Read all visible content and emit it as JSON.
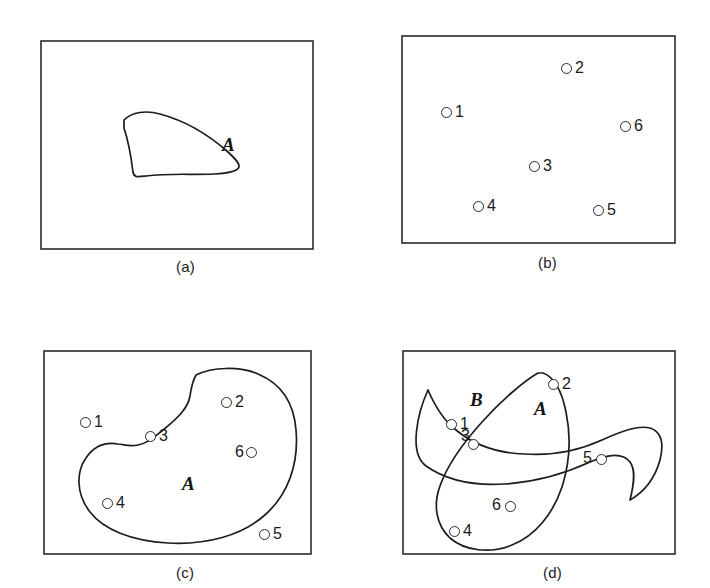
{
  "figure": {
    "width": 710,
    "height": 588,
    "background": "#ffffff",
    "ink_color": "#1a1a1a"
  },
  "panels": [
    {
      "id": "a",
      "caption": "(a)",
      "caption_x": 176,
      "caption_y": 258,
      "frame": {
        "x": 41,
        "y": 41,
        "w": 272,
        "h": 208
      },
      "region_labels": [
        {
          "text": "A",
          "x": 222,
          "y": 135
        }
      ],
      "points": [],
      "shapes": [
        {
          "name": "region-a-blob",
          "path": "M 124 120 C 132 112, 146 110, 160 114 C 186 121, 210 136, 228 152 C 241 164, 249 172, 214 174 C 190 175, 168 173, 146 176 C 138 177, 134 178, 133 172 C 131 156, 128 140, 124 128 Z"
        }
      ]
    },
    {
      "id": "b",
      "caption": "(b)",
      "caption_x": 538,
      "caption_y": 254,
      "frame": {
        "x": 402,
        "y": 36,
        "w": 273,
        "h": 207
      },
      "region_labels": [],
      "points": [
        {
          "id": "1",
          "cx": 446,
          "cy": 112,
          "label_x": 455,
          "label_y": 104
        },
        {
          "id": "2",
          "cx": 566,
          "cy": 68,
          "label_x": 575,
          "label_y": 60
        },
        {
          "id": "3",
          "cx": 534,
          "cy": 166,
          "label_x": 543,
          "label_y": 158
        },
        {
          "id": "4",
          "cx": 478,
          "cy": 206,
          "label_x": 487,
          "label_y": 198
        },
        {
          "id": "5",
          "cx": 598,
          "cy": 210,
          "label_x": 607,
          "label_y": 202
        },
        {
          "id": "6",
          "cx": 625,
          "cy": 126,
          "label_x": 634,
          "label_y": 118
        }
      ],
      "shapes": []
    },
    {
      "id": "c",
      "caption": "(c)",
      "caption_x": 176,
      "caption_y": 564,
      "frame": {
        "x": 44,
        "y": 351,
        "w": 267,
        "h": 203
      },
      "region_labels": [
        {
          "text": "A",
          "x": 182,
          "y": 474
        }
      ],
      "points": [
        {
          "id": "1",
          "cx": 85,
          "cy": 422,
          "label_x": 94,
          "label_y": 414
        },
        {
          "id": "2",
          "cx": 226,
          "cy": 402,
          "label_x": 235,
          "label_y": 394
        },
        {
          "id": "3",
          "cx": 150,
          "cy": 436,
          "label_x": 159,
          "label_y": 428
        },
        {
          "id": "4",
          "cx": 107,
          "cy": 503,
          "label_x": 116,
          "label_y": 495
        },
        {
          "id": "5",
          "cx": 264,
          "cy": 534,
          "label_x": 273,
          "label_y": 526
        },
        {
          "id": "6",
          "cx": 251,
          "cy": 452,
          "label_x": 235,
          "label_y": 444
        }
      ],
      "shapes": [
        {
          "name": "region-a-crescent",
          "path": "M 196 375 C 212 367, 240 366, 258 374 C 282 384, 294 404, 296 430 C 299 464, 288 494, 266 514 C 242 536, 206 545, 168 543 C 132 541, 104 530, 90 512 C 76 494, 76 472, 86 458 C 94 446, 106 442, 118 444 C 126 445, 130 447, 138 445 C 148 443, 154 437, 163 430 C 178 418, 188 408, 190 396 C 191 389, 192 382, 196 375 Z"
        }
      ]
    },
    {
      "id": "d",
      "caption": "(d)",
      "caption_x": 543,
      "caption_y": 564,
      "frame": {
        "x": 403,
        "y": 351,
        "w": 272,
        "h": 203
      },
      "region_labels": [
        {
          "text": "B",
          "x": 470,
          "y": 390
        },
        {
          "text": "A",
          "x": 534,
          "y": 399
        }
      ],
      "points": [
        {
          "id": "1",
          "cx": 451,
          "cy": 424,
          "label_x": 460,
          "label_y": 416
        },
        {
          "id": "2",
          "cx": 553,
          "cy": 384,
          "label_x": 562,
          "label_y": 376
        },
        {
          "id": "3",
          "cx": 473,
          "cy": 444,
          "label_x": 461,
          "label_y": 430
        },
        {
          "id": "4",
          "cx": 454,
          "cy": 531,
          "label_x": 463,
          "label_y": 523
        },
        {
          "id": "5",
          "cx": 601,
          "cy": 459,
          "label_x": 583,
          "label_y": 450
        },
        {
          "id": "6",
          "cx": 510,
          "cy": 506,
          "label_x": 492,
          "label_y": 497
        }
      ],
      "shapes": [
        {
          "name": "region-a-outline",
          "path": "M 543 373 C 554 377, 562 392, 566 412 C 571 436, 570 462, 562 487 C 553 514, 535 536, 512 545 C 490 554, 465 551, 450 538 C 436 525, 433 505, 440 486 C 448 463, 464 442, 482 422 C 502 400, 524 381, 538 373 Z"
        },
        {
          "name": "region-b-outline",
          "path": "M 428 390 C 434 404, 442 419, 456 430 C 474 445, 498 453, 524 454 C 552 456, 580 450, 602 440 C 622 431, 638 425, 650 428 C 662 432, 664 444, 660 460 C 655 478, 644 492, 630 500 C 634 484, 636 470, 630 462 C 623 453, 608 454, 590 462 C 566 473, 536 482, 505 484 C 474 486, 446 480, 426 466 C 408 453, 418 412, 428 390 Z"
        }
      ]
    }
  ]
}
